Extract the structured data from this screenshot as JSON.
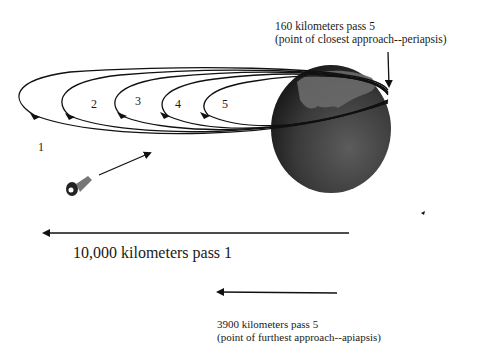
{
  "diagram": {
    "periapsis_label": {
      "line1": "160 kilometers pass 5",
      "line2": "(point of closest approach--periapsis)"
    },
    "pass_numbers": [
      "1",
      "2",
      "3",
      "4",
      "5"
    ],
    "distance_label": "10,000 kilometers pass 1",
    "apoapsis_label": {
      "line1": "3900 kilometers pass 5",
      "line2": "(point of furthest approach--apiapsis)"
    },
    "elements": {
      "planet": "planet-sphere",
      "spacecraft": "spacecraft",
      "orbits": 5
    },
    "colors": {
      "background": "#ffffff",
      "line": "#111111",
      "planet_dark": "#1e1e1e",
      "planet_light": "#5a5a5a"
    }
  }
}
